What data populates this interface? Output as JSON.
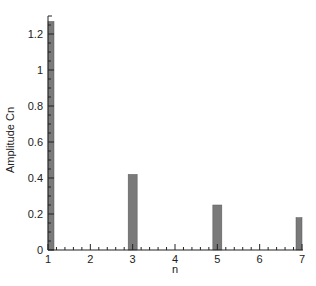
{
  "chart_data": {
    "type": "bar",
    "title": "",
    "xlabel": "n",
    "ylabel": "Amplitude Cn",
    "x": [
      1,
      3,
      5,
      7
    ],
    "values": [
      1.27,
      0.42,
      0.25,
      0.18
    ],
    "xlim": [
      1,
      7
    ],
    "ylim": [
      0,
      1.3
    ],
    "xticks": [
      "1",
      "2",
      "3",
      "4",
      "5",
      "6",
      "7"
    ],
    "yticks": [
      "0",
      "0.2",
      "0.4",
      "0.6",
      "0.8",
      "1",
      "1.2"
    ],
    "grid": false,
    "legend": null,
    "bar_color": "#7a7a7a"
  }
}
